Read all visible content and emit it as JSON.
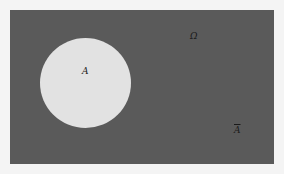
{
  "diagram": {
    "type": "venn",
    "universe": {
      "label": "Ω",
      "fill_color": "#5a5a5a"
    },
    "sets": [
      {
        "name": "A",
        "label": "A",
        "fill_color": "#e2e2e2"
      }
    ],
    "complement": {
      "label": "A",
      "notation": "overline"
    }
  }
}
